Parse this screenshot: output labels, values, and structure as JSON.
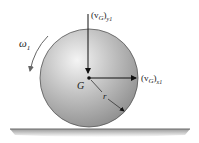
{
  "diagram": {
    "labels": {
      "omega": "ω",
      "omega_sub": "1",
      "vGy_main": "(v",
      "vGy_G": "G",
      "vGy_close": ")",
      "vGy_sub": "y1",
      "vGx_main": "(v",
      "vGx_G": "G",
      "vGx_close": ")",
      "vGx_sub": "x1",
      "center": "G",
      "radius": "r"
    },
    "colors": {
      "sphere_light": "#f2f2f2",
      "sphere_mid": "#bdbdbd",
      "sphere_dark": "#8a8a8a",
      "outline": "#555555",
      "ground": "#777777",
      "arrow": "#111111"
    }
  }
}
